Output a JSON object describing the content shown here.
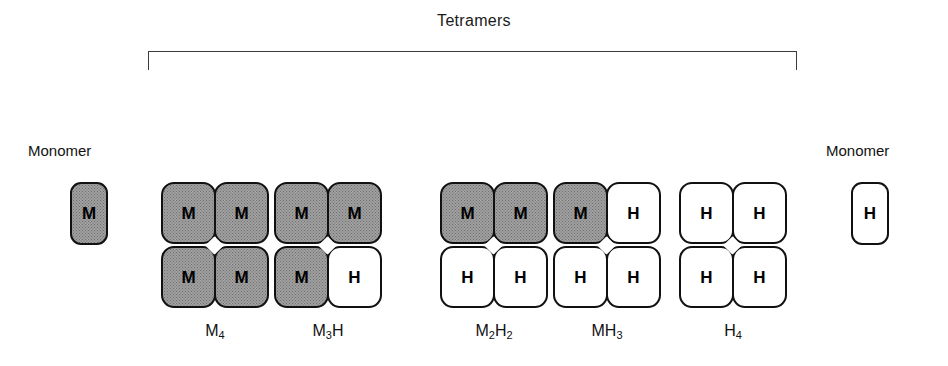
{
  "figure": {
    "bracket_label": "Tetramers",
    "monomer_label_left": "Monomer",
    "monomer_label_right": "Monomer",
    "colors": {
      "m_subunit_fill": "#a0a0a0",
      "h_subunit_fill": "#ffffff",
      "outline": "#111111",
      "background": "#ffffff"
    }
  },
  "monomers": [
    {
      "letter": "M",
      "type": "m"
    },
    {
      "letter": "H",
      "type": "h"
    }
  ],
  "tetramers": [
    {
      "label_main": "M",
      "label_sub": "4",
      "subunits": [
        {
          "letter": "M",
          "type": "m"
        },
        {
          "letter": "M",
          "type": "m"
        },
        {
          "letter": "M",
          "type": "m"
        },
        {
          "letter": "M",
          "type": "m"
        }
      ]
    },
    {
      "label_main": "M",
      "label_sub": "3",
      "label_tail": "H",
      "subunits": [
        {
          "letter": "M",
          "type": "m"
        },
        {
          "letter": "M",
          "type": "m"
        },
        {
          "letter": "M",
          "type": "m"
        },
        {
          "letter": "H",
          "type": "h"
        }
      ]
    },
    {
      "label_main": "M",
      "label_sub": "2",
      "label_tail": "H",
      "label_tail_sub": "2",
      "subunits": [
        {
          "letter": "M",
          "type": "m"
        },
        {
          "letter": "M",
          "type": "m"
        },
        {
          "letter": "H",
          "type": "h"
        },
        {
          "letter": "H",
          "type": "h"
        }
      ]
    },
    {
      "label_main": "MH",
      "label_sub": "3",
      "subunits": [
        {
          "letter": "M",
          "type": "m"
        },
        {
          "letter": "H",
          "type": "h"
        },
        {
          "letter": "H",
          "type": "h"
        },
        {
          "letter": "H",
          "type": "h"
        }
      ]
    },
    {
      "label_main": "H",
      "label_sub": "4",
      "subunits": [
        {
          "letter": "H",
          "type": "h"
        },
        {
          "letter": "H",
          "type": "h"
        },
        {
          "letter": "H",
          "type": "h"
        },
        {
          "letter": "H",
          "type": "h"
        }
      ]
    }
  ]
}
